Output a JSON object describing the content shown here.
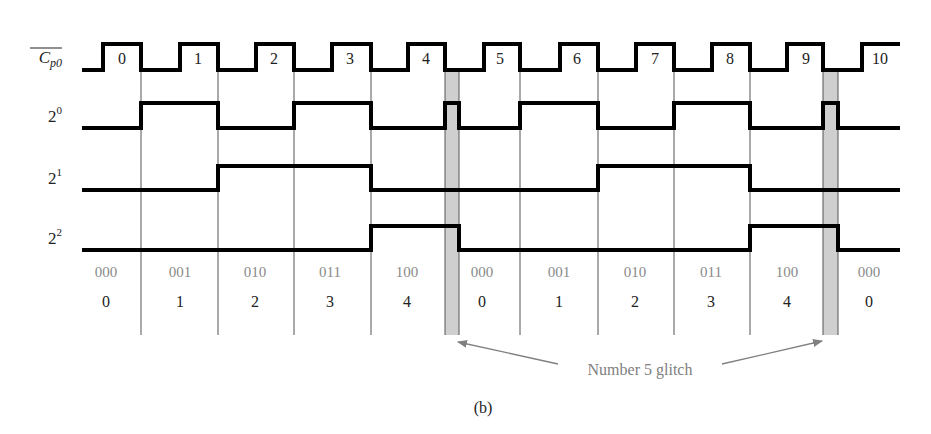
{
  "figure": {
    "caption": "(b)",
    "annotation": "Number 5 glitch",
    "colors": {
      "waveform": "#000000",
      "gridline": "#555555",
      "glitch_fill": "#cfcfcf",
      "binary_text": "#8a8a8a",
      "decimal_text": "#222222",
      "annotation_text": "#808080",
      "arrow": "#808080"
    }
  },
  "signals": [
    {
      "id": "cp0",
      "label_base": "C",
      "label_sub": "p0",
      "overline": true,
      "high_y": 44,
      "low_y": 70,
      "points": [
        [
          82,
          70
        ],
        [
          103,
          70
        ],
        [
          103,
          44
        ],
        [
          141,
          44
        ],
        [
          141,
          70
        ],
        [
          180,
          70
        ],
        [
          180,
          44
        ],
        [
          218,
          44
        ],
        [
          218,
          70
        ],
        [
          256,
          70
        ],
        [
          256,
          44
        ],
        [
          294,
          44
        ],
        [
          294,
          70
        ],
        [
          332,
          70
        ],
        [
          332,
          44
        ],
        [
          371,
          44
        ],
        [
          371,
          70
        ],
        [
          408,
          70
        ],
        [
          408,
          44
        ],
        [
          445,
          44
        ],
        [
          445,
          70
        ],
        [
          484,
          70
        ],
        [
          484,
          44
        ],
        [
          520,
          44
        ],
        [
          520,
          70
        ],
        [
          560,
          70
        ],
        [
          560,
          44
        ],
        [
          598,
          44
        ],
        [
          598,
          70
        ],
        [
          636,
          70
        ],
        [
          636,
          44
        ],
        [
          674,
          44
        ],
        [
          674,
          70
        ],
        [
          712,
          70
        ],
        [
          712,
          44
        ],
        [
          750,
          44
        ],
        [
          750,
          70
        ],
        [
          787,
          70
        ],
        [
          787,
          44
        ],
        [
          823,
          44
        ],
        [
          823,
          70
        ],
        [
          862,
          70
        ],
        [
          862,
          44
        ],
        [
          900,
          44
        ]
      ]
    },
    {
      "id": "q0",
      "label_base": "2",
      "label_sup": "0",
      "high_y": 103,
      "low_y": 128,
      "points": [
        [
          82,
          128
        ],
        [
          141,
          128
        ],
        [
          141,
          103
        ],
        [
          218,
          103
        ],
        [
          218,
          128
        ],
        [
          294,
          128
        ],
        [
          294,
          103
        ],
        [
          371,
          103
        ],
        [
          371,
          128
        ],
        [
          445,
          128
        ],
        [
          445,
          103
        ],
        [
          459,
          103
        ],
        [
          459,
          128
        ],
        [
          520,
          128
        ],
        [
          520,
          103
        ],
        [
          598,
          103
        ],
        [
          598,
          128
        ],
        [
          674,
          128
        ],
        [
          674,
          103
        ],
        [
          750,
          103
        ],
        [
          750,
          128
        ],
        [
          823,
          128
        ],
        [
          823,
          103
        ],
        [
          838,
          103
        ],
        [
          838,
          128
        ],
        [
          900,
          128
        ]
      ]
    },
    {
      "id": "q1",
      "label_base": "2",
      "label_sup": "1",
      "high_y": 166,
      "low_y": 190,
      "points": [
        [
          82,
          190
        ],
        [
          218,
          190
        ],
        [
          218,
          166
        ],
        [
          371,
          166
        ],
        [
          371,
          190
        ],
        [
          598,
          190
        ],
        [
          598,
          166
        ],
        [
          750,
          166
        ],
        [
          750,
          190
        ],
        [
          900,
          190
        ]
      ]
    },
    {
      "id": "q2",
      "label_base": "2",
      "label_sup": "2",
      "high_y": 226,
      "low_y": 250,
      "points": [
        [
          82,
          250
        ],
        [
          371,
          250
        ],
        [
          371,
          226
        ],
        [
          459,
          226
        ],
        [
          459,
          250
        ],
        [
          750,
          250
        ],
        [
          750,
          226
        ],
        [
          838,
          226
        ],
        [
          838,
          250
        ],
        [
          900,
          250
        ]
      ]
    }
  ],
  "clock_pulse_numbers": [
    {
      "text": "0",
      "x": 122
    },
    {
      "text": "1",
      "x": 198
    },
    {
      "text": "2",
      "x": 274
    },
    {
      "text": "3",
      "x": 350
    },
    {
      "text": "4",
      "x": 426
    },
    {
      "text": "5",
      "x": 500
    },
    {
      "text": "6",
      "x": 577
    },
    {
      "text": "7",
      "x": 655
    },
    {
      "text": "8",
      "x": 730
    },
    {
      "text": "9",
      "x": 806
    },
    {
      "text": "10",
      "x": 880
    }
  ],
  "gridlines_x": [
    141,
    218,
    294,
    371,
    445,
    459,
    520,
    598,
    674,
    750,
    823,
    838
  ],
  "glitch_bands": [
    {
      "x1": 445,
      "x2": 459
    },
    {
      "x1": 823,
      "x2": 838
    }
  ],
  "states": [
    {
      "binary": "000",
      "decimal": "0",
      "x": 106
    },
    {
      "binary": "001",
      "decimal": "1",
      "x": 180
    },
    {
      "binary": "010",
      "decimal": "2",
      "x": 255
    },
    {
      "binary": "011",
      "decimal": "3",
      "x": 330
    },
    {
      "binary": "100",
      "decimal": "4",
      "x": 407
    },
    {
      "binary": "000",
      "decimal": "0",
      "x": 482
    },
    {
      "binary": "001",
      "decimal": "1",
      "x": 559
    },
    {
      "binary": "010",
      "decimal": "2",
      "x": 635
    },
    {
      "binary": "011",
      "decimal": "3",
      "x": 711
    },
    {
      "binary": "100",
      "decimal": "4",
      "x": 787
    },
    {
      "binary": "000",
      "decimal": "0",
      "x": 869
    }
  ]
}
